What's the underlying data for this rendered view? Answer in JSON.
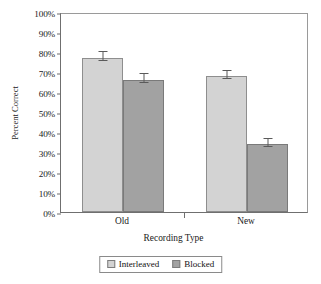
{
  "chart_data": {
    "type": "bar",
    "title": "",
    "xlabel": "Recording Type",
    "ylabel": "Percent Correct",
    "categories": [
      "Old",
      "New"
    ],
    "ylim": [
      0,
      100
    ],
    "ytick_values": [
      0,
      10,
      20,
      30,
      40,
      50,
      60,
      70,
      80,
      90,
      100
    ],
    "ytick_labels": [
      "0%",
      "10%",
      "20%",
      "30%",
      "40%",
      "50%",
      "60%",
      "70%",
      "80%",
      "90%",
      "100%"
    ],
    "grid": false,
    "legend_position": "bottom",
    "series": [
      {
        "name": "Interleaved",
        "color": "#d3d3d3",
        "values": [
          77,
          68
        ],
        "errors": [
          4.5,
          4.0
        ]
      },
      {
        "name": "Blocked",
        "color": "#a2a2a2",
        "values": [
          66,
          34
        ],
        "errors": [
          4.5,
          4.0
        ]
      }
    ]
  },
  "legend": {
    "items": [
      {
        "label": "Interleaved"
      },
      {
        "label": "Blocked"
      }
    ]
  }
}
